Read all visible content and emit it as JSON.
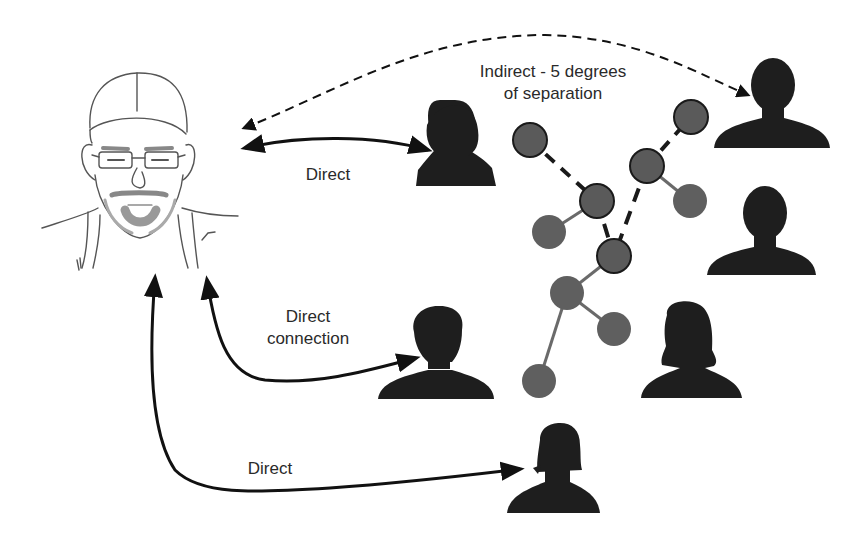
{
  "diagram": {
    "title": "Degrees of separation",
    "colors": {
      "silhouette": "#1e1e1e",
      "node_fill": "#5a5a5a",
      "node_stroke": "#1a1a1a",
      "arrow": "#111111",
      "sketch": "#555555",
      "text": "#2a2a2a"
    },
    "labels": {
      "indirect_line1": "Indirect - 5 degrees",
      "indirect_line2": "of separation",
      "direct_top": "Direct",
      "direct_connection_line1": "Direct",
      "direct_connection_line2": "connection",
      "direct_bottom": "Direct"
    },
    "people": [
      {
        "id": "self",
        "type": "sketch-portrait",
        "label": "Self (cap & glasses)"
      },
      {
        "id": "woman-top",
        "type": "female-silhouette"
      },
      {
        "id": "man-top-right",
        "type": "male-silhouette"
      },
      {
        "id": "man-right",
        "type": "male-silhouette"
      },
      {
        "id": "man-middle",
        "type": "male-silhouette"
      },
      {
        "id": "woman-bottom-right",
        "type": "female-silhouette"
      },
      {
        "id": "woman-bottom",
        "type": "female-silhouette"
      }
    ],
    "network_nodes": [
      {
        "x": 530,
        "y": 140
      },
      {
        "x": 597,
        "y": 201
      },
      {
        "x": 647,
        "y": 166
      },
      {
        "x": 691,
        "y": 117
      },
      {
        "x": 690,
        "y": 201
      },
      {
        "x": 549,
        "y": 232
      },
      {
        "x": 614,
        "y": 256
      },
      {
        "x": 567,
        "y": 293
      },
      {
        "x": 614,
        "y": 329
      },
      {
        "x": 539,
        "y": 381
      }
    ],
    "connections": [
      {
        "from": "self",
        "to": "woman-top",
        "kind": "direct",
        "label": "Direct"
      },
      {
        "from": "self",
        "to": "man-middle",
        "kind": "direct",
        "label": "Direct connection"
      },
      {
        "from": "self",
        "to": "woman-bottom",
        "kind": "direct",
        "label": "Direct"
      },
      {
        "from": "self",
        "to": "man-top-right",
        "kind": "indirect",
        "label": "Indirect - 5 degrees of separation"
      }
    ]
  }
}
